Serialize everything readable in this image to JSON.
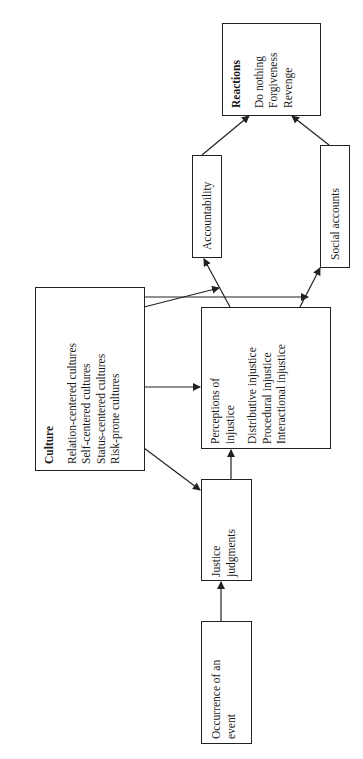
{
  "diagram": {
    "orientation": "rotated -90deg",
    "nodes": {
      "reactions": {
        "title": "Reactions",
        "items": [
          "Do nothing",
          "Forgiveness",
          "Revenge"
        ]
      },
      "accountability": {
        "label": "Accountability"
      },
      "social_accounts": {
        "label": "Social accounts"
      },
      "culture": {
        "title": "Culture",
        "items": [
          "Relation-centered cultures",
          "Self-centered cultures",
          "Status-centered cultures",
          "Risk-prone cultures"
        ]
      },
      "perceptions": {
        "title_lines": [
          "Perceptions of",
          "injustice"
        ],
        "items": [
          "Distributive injustice",
          "Procedural injustice",
          "Interactional injustice"
        ]
      },
      "justice_judgments": {
        "lines": [
          "Justice",
          "judgments"
        ]
      },
      "occurrence": {
        "lines": [
          "Occurrence of an",
          "event"
        ]
      }
    },
    "edges": [
      {
        "from": "Occurrence of an event",
        "to": "Justice judgments"
      },
      {
        "from": "Justice judgments",
        "to": "Perceptions of injustice"
      },
      {
        "from": "Culture",
        "to": "Justice judgments"
      },
      {
        "from": "Culture",
        "to": "Perceptions of injustice"
      },
      {
        "from": "Culture",
        "to": "Perceptions→Accountability link"
      },
      {
        "from": "Culture",
        "to": "Perceptions→Social accounts link"
      },
      {
        "from": "Perceptions of injustice",
        "to": "Accountability"
      },
      {
        "from": "Perceptions of injustice",
        "to": "Social accounts"
      },
      {
        "from": "Accountability",
        "to": "Reactions"
      },
      {
        "from": "Social accounts",
        "to": "Reactions"
      }
    ],
    "colors": {
      "line": "#222222",
      "background": "#ffffff"
    }
  }
}
